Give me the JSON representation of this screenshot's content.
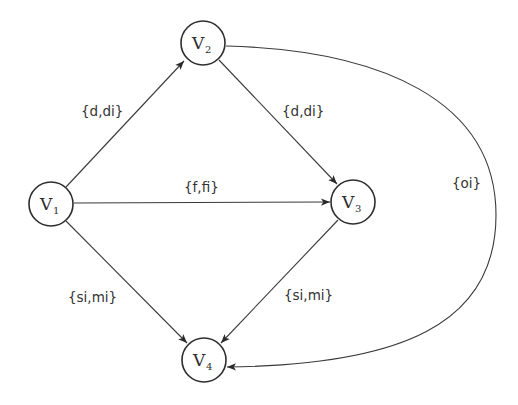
{
  "diagram": {
    "type": "directed-graph",
    "nodes": [
      {
        "id": "V1",
        "base": "V",
        "sub": "1",
        "cx": 51,
        "cy": 204
      },
      {
        "id": "V2",
        "base": "V",
        "sub": "2",
        "cx": 203,
        "cy": 43
      },
      {
        "id": "V3",
        "base": "V",
        "sub": "3",
        "cx": 353,
        "cy": 202
      },
      {
        "id": "V4",
        "base": "V",
        "sub": "4",
        "cx": 204,
        "cy": 360
      }
    ],
    "edges": [
      {
        "from": "V1",
        "to": "V2",
        "label": "{d,di}"
      },
      {
        "from": "V2",
        "to": "V3",
        "label": "{d,di}"
      },
      {
        "from": "V1",
        "to": "V3",
        "label": "{f,fi}"
      },
      {
        "from": "V1",
        "to": "V4",
        "label": "{si,mi}"
      },
      {
        "from": "V3",
        "to": "V4",
        "label": "{si,mi}"
      },
      {
        "from": "V2",
        "to": "V4",
        "label": "{oi}",
        "curved": true
      }
    ]
  },
  "labels": {
    "v1_base": "V",
    "v1_sub": "1",
    "v2_base": "V",
    "v2_sub": "2",
    "v3_base": "V",
    "v3_sub": "3",
    "v4_base": "V",
    "v4_sub": "4",
    "e12": "{d,di}",
    "e23": "{d,di}",
    "e13": "{f,fi}",
    "e14": "{si,mi}",
    "e34": "{si,mi}",
    "e24": "{oi}"
  },
  "colors": {
    "stroke": "#2e2e2e",
    "background": "#ffffff"
  }
}
